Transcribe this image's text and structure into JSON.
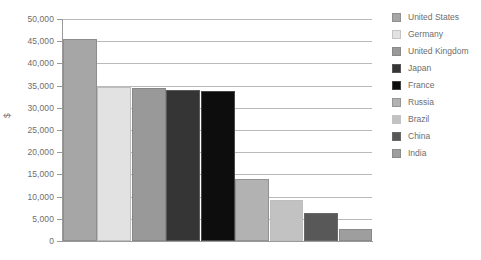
{
  "chart_data": {
    "type": "bar",
    "title": "",
    "xlabel": "",
    "ylabel": "$",
    "ylim": [
      0,
      50000
    ],
    "ytick_values": [
      50000,
      45000,
      40000,
      35000,
      30000,
      25000,
      20000,
      15000,
      10000,
      5000,
      0
    ],
    "ytick_labels": [
      "50,000",
      "45,000",
      "40,000",
      "35,000",
      "30,000",
      "25,000",
      "20,000",
      "15,000",
      "10,000",
      "5,000",
      "0"
    ],
    "grid": true,
    "legend_position": "right",
    "categories": [
      "United States",
      "Germany",
      "United Kingdom",
      "Japan",
      "France",
      "Russia",
      "Brazil",
      "China",
      "India"
    ],
    "values": [
      45600,
      34700,
      34400,
      34000,
      33700,
      14000,
      9200,
      6200,
      2600
    ],
    "colors": [
      "#a6a6a6",
      "#e2e2e2",
      "#999999",
      "#353535",
      "#0d0d0d",
      "#b2b2b2",
      "#c2c2c2",
      "#585858",
      "#9e9e9e"
    ]
  },
  "legend": {
    "items": [
      {
        "label": "United States",
        "color": "#a6a6a6"
      },
      {
        "label": "Germany",
        "color": "#e2e2e2"
      },
      {
        "label": "United Kingdom",
        "color": "#999999"
      },
      {
        "label": "Japan",
        "color": "#353535"
      },
      {
        "label": "France",
        "color": "#0d0d0d"
      },
      {
        "label": "Russia",
        "color": "#b2b2b2"
      },
      {
        "label": "Brazil",
        "color": "#c2c2c2"
      },
      {
        "label": "China",
        "color": "#585858"
      },
      {
        "label": "India",
        "color": "#9e9e9e"
      }
    ]
  }
}
